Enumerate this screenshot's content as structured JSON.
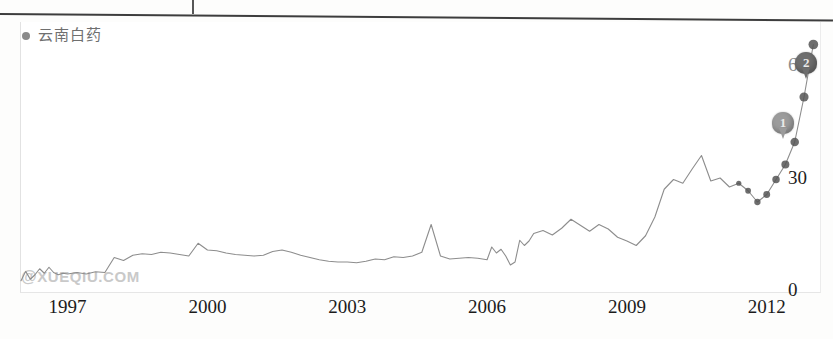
{
  "legend": {
    "series_name": "云南白药",
    "dot_color": "#8a8a8a"
  },
  "watermark": {
    "at": "@",
    "text": "XUEQIU.COM"
  },
  "markers": [
    {
      "label": "1"
    },
    {
      "label": "2"
    }
  ],
  "chart_data": {
    "type": "line",
    "title": "",
    "subtitle": "",
    "xlabel": "",
    "ylabel": "",
    "grid": false,
    "legend_position": "top-left",
    "series": [
      {
        "name": "云南白药",
        "color": "#8d8d8d",
        "x": [
          1996.0,
          1996.1,
          1996.2,
          1996.3,
          1996.4,
          1996.5,
          1996.6,
          1996.7,
          1996.8,
          1996.9,
          1997.0,
          1997.2,
          1997.4,
          1997.6,
          1997.8,
          1998.0,
          1998.2,
          1998.4,
          1998.6,
          1998.8,
          1999.0,
          1999.2,
          1999.4,
          1999.6,
          1999.8,
          2000.0,
          2000.2,
          2000.4,
          2000.6,
          2000.8,
          2001.0,
          2001.2,
          2001.4,
          2001.6,
          2001.8,
          2002.0,
          2002.2,
          2002.4,
          2002.6,
          2002.8,
          2003.0,
          2003.2,
          2003.4,
          2003.6,
          2003.8,
          2004.0,
          2004.2,
          2004.4,
          2004.6,
          2004.8,
          2005.0,
          2005.2,
          2005.4,
          2005.6,
          2005.8,
          2006.0,
          2006.1,
          2006.2,
          2006.3,
          2006.4,
          2006.5,
          2006.6,
          2006.7,
          2006.8,
          2006.9,
          2007.0,
          2007.2,
          2007.4,
          2007.6,
          2007.8,
          2008.0,
          2008.2,
          2008.4,
          2008.6,
          2008.8,
          2009.0,
          2009.2,
          2009.4,
          2009.6,
          2009.8,
          2010.0,
          2010.2,
          2010.4,
          2010.6,
          2010.8,
          2011.0,
          2011.2,
          2011.4,
          2011.6,
          2011.8,
          2012.0,
          2012.2,
          2012.4,
          2012.6,
          2012.8,
          2013.0
        ],
        "y": [
          3.0,
          5.5,
          3.4,
          4.6,
          6.2,
          5.0,
          6.6,
          5.2,
          4.6,
          5.0,
          4.8,
          5.2,
          4.8,
          5.4,
          5.2,
          9.2,
          8.4,
          9.8,
          10.2,
          10.0,
          10.6,
          10.4,
          10.0,
          9.6,
          13.0,
          11.2,
          11.0,
          10.4,
          10.0,
          9.8,
          9.6,
          9.8,
          10.8,
          11.2,
          10.6,
          9.8,
          9.2,
          8.6,
          8.2,
          8.0,
          8.0,
          7.8,
          8.2,
          8.8,
          8.6,
          9.4,
          9.2,
          9.6,
          10.6,
          18.0,
          9.6,
          8.8,
          9.0,
          9.2,
          9.0,
          8.6,
          12.0,
          10.4,
          11.4,
          9.6,
          7.2,
          8.0,
          13.8,
          12.4,
          13.6,
          15.6,
          16.4,
          15.2,
          17.0,
          19.4,
          17.8,
          16.2,
          18.0,
          16.8,
          14.6,
          13.6,
          12.4,
          15.0,
          20.0,
          27.4,
          30.0,
          29.0,
          32.8,
          36.4,
          29.6,
          30.4,
          28.0,
          29.0,
          27.0,
          24.0,
          26.0,
          30.0,
          34.0,
          40.0,
          52.0,
          66.0
        ]
      }
    ],
    "y_ticks": [
      {
        "value": 0,
        "label": "0"
      },
      {
        "value": 30,
        "label": "30"
      },
      {
        "value": 60,
        "label": "60"
      }
    ],
    "x_ticks": [
      {
        "value": 1997,
        "label": "1997"
      },
      {
        "value": 2000,
        "label": "2000"
      },
      {
        "value": 2003,
        "label": "2003"
      },
      {
        "value": 2006,
        "label": "2006"
      },
      {
        "value": 2009,
        "label": "2009"
      },
      {
        "value": 2012,
        "label": "2012"
      }
    ],
    "xlim": [
      1996.0,
      2013.1
    ],
    "ylim": [
      0,
      72
    ],
    "annotations": [
      {
        "label": "1",
        "x": 2012.35,
        "y": 41.0
      },
      {
        "label": "2",
        "x": 2012.85,
        "y": 57.0
      }
    ]
  }
}
